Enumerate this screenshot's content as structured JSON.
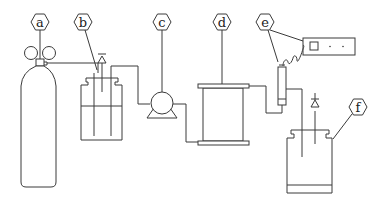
{
  "diagram": {
    "title": "",
    "labels": {
      "a": "a",
      "b": "b",
      "c": "c",
      "d": "d",
      "e": "e",
      "f": "f"
    },
    "components": [
      {
        "id": "a",
        "name": "gas-cylinder"
      },
      {
        "id": "b",
        "name": "feed-bottle"
      },
      {
        "id": "c",
        "name": "pump"
      },
      {
        "id": "d",
        "name": "membrane-module"
      },
      {
        "id": "e",
        "name": "sensor-meter"
      },
      {
        "id": "f",
        "name": "collection-bottle"
      }
    ]
  }
}
